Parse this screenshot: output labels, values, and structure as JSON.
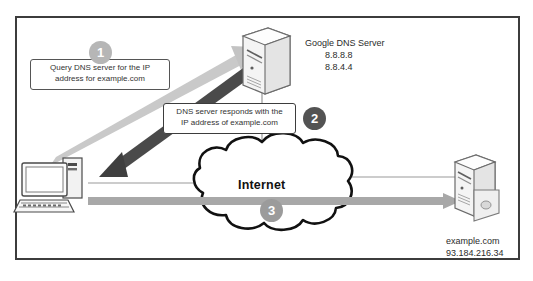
{
  "diagram": {
    "frame": {
      "border_color": "#3c3c3c",
      "background": "#ffffff"
    },
    "steps": [
      {
        "number": "1",
        "color": "#b6b6b6",
        "callout": "Query DNS server for the IP address for example.com"
      },
      {
        "number": "2",
        "color": "#535353",
        "callout": "DNS server responds with the IP address of example.com"
      },
      {
        "number": "3",
        "color": "#9b9b9b",
        "callout": ""
      }
    ],
    "callouts": {
      "query": {
        "line1": "Query DNS server for the IP",
        "line2": "address for example.com"
      },
      "respond": {
        "line1": "DNS server responds with the",
        "line2": "IP address of example.com"
      }
    },
    "nodes": {
      "client": {
        "name": "client-computer",
        "label": ""
      },
      "dns_server": {
        "name": "Google DNS Server",
        "ip_primary": "8.8.8.8",
        "ip_secondary": "8.8.4.4"
      },
      "cloud": {
        "label": "Internet"
      },
      "web_server": {
        "hostname": "example.com",
        "ip": "93.184.216.34"
      }
    },
    "arrows": {
      "query_arrow": {
        "color": "#c9c9c9",
        "direction": "client-to-dns"
      },
      "response_arrow": {
        "color": "#4a4a4a",
        "direction": "dns-to-client"
      },
      "internet_arrow": {
        "color": "#a8a8a8",
        "direction": "client-to-web-server"
      }
    }
  }
}
